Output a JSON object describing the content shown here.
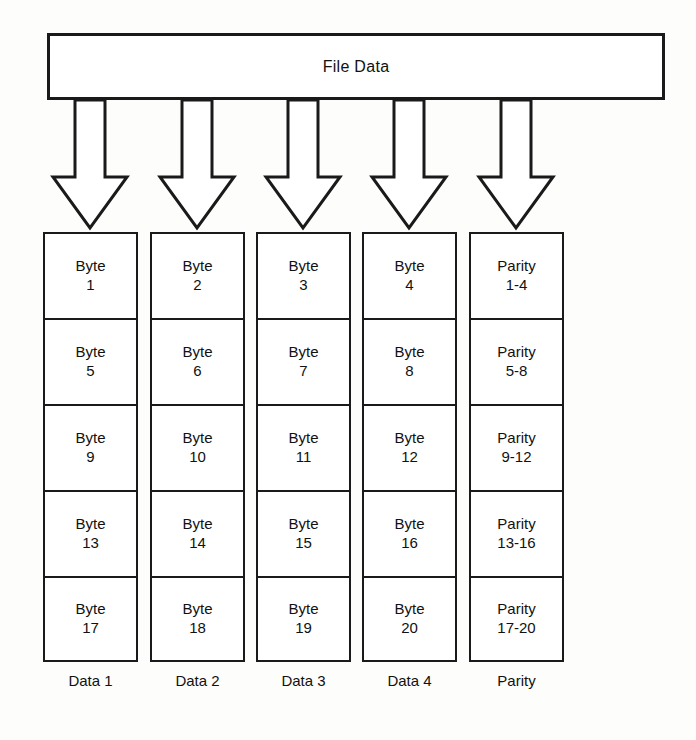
{
  "diagram": {
    "title": "File Data",
    "source_box": {
      "label": "File Data"
    },
    "arrow_icon_name": "down-arrow-icon",
    "columns": [
      {
        "label": "Data 1",
        "cells": [
          {
            "line1": "Byte",
            "line2": "1"
          },
          {
            "line1": "Byte",
            "line2": "5"
          },
          {
            "line1": "Byte",
            "line2": "9"
          },
          {
            "line1": "Byte",
            "line2": "13"
          },
          {
            "line1": "Byte",
            "line2": "17"
          }
        ]
      },
      {
        "label": "Data 2",
        "cells": [
          {
            "line1": "Byte",
            "line2": "2"
          },
          {
            "line1": "Byte",
            "line2": "6"
          },
          {
            "line1": "Byte",
            "line2": "10"
          },
          {
            "line1": "Byte",
            "line2": "14"
          },
          {
            "line1": "Byte",
            "line2": "18"
          }
        ]
      },
      {
        "label": "Data 3",
        "cells": [
          {
            "line1": "Byte",
            "line2": "3"
          },
          {
            "line1": "Byte",
            "line2": "7"
          },
          {
            "line1": "Byte",
            "line2": "11"
          },
          {
            "line1": "Byte",
            "line2": "15"
          },
          {
            "line1": "Byte",
            "line2": "19"
          }
        ]
      },
      {
        "label": "Data 4",
        "cells": [
          {
            "line1": "Byte",
            "line2": "4"
          },
          {
            "line1": "Byte",
            "line2": "8"
          },
          {
            "line1": "Byte",
            "line2": "12"
          },
          {
            "line1": "Byte",
            "line2": "16"
          },
          {
            "line1": "Byte",
            "line2": "20"
          }
        ]
      },
      {
        "label": "Parity",
        "cells": [
          {
            "line1": "Parity",
            "line2": "1-4"
          },
          {
            "line1": "Parity",
            "line2": "5-8"
          },
          {
            "line1": "Parity",
            "line2": "9-12"
          },
          {
            "line1": "Parity",
            "line2": "13-16"
          },
          {
            "line1": "Parity",
            "line2": "17-20"
          }
        ]
      }
    ],
    "colors": {
      "stroke": "#1a1a1a",
      "fill": "#ffffff",
      "background": "#fdfdfc"
    }
  }
}
